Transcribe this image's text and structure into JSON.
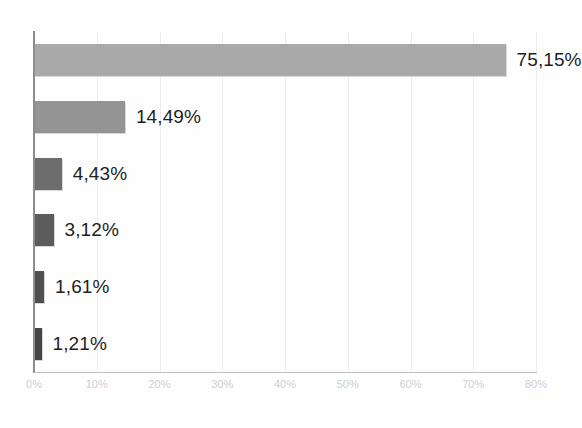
{
  "chart_data": {
    "type": "bar",
    "orientation": "horizontal",
    "title": "",
    "subtitle": "",
    "xlabel": "",
    "ylabel": "",
    "categories": [
      "",
      "",
      "",
      "",
      "",
      ""
    ],
    "values": [
      75.15,
      14.49,
      4.43,
      3.12,
      1.61,
      1.21
    ],
    "data_labels": [
      "75,15%",
      "14,49%",
      "4,43%",
      "3,12%",
      "1,61%",
      "1,21%"
    ],
    "bar_colors": [
      "#a9a9a9",
      "#949494",
      "#6d6d6d",
      "#5c5c5c",
      "#4f4f4f",
      "#454545"
    ],
    "xlim": [
      0,
      80
    ],
    "xticks": [
      0,
      10,
      20,
      30,
      40,
      50,
      60,
      70,
      80
    ],
    "xtick_labels": [
      "0%",
      "10%",
      "20%",
      "30%",
      "40%",
      "50%",
      "60%",
      "70%",
      "80%"
    ],
    "grid": true,
    "grid_axis": "x",
    "grid_color": "#ededed",
    "legend": false,
    "legend_position": "none",
    "axis_color": "#8d8d8d",
    "tick_label_color": "#cfcfcf",
    "data_label_color": "#1f1f1f",
    "background": "#ffffff",
    "decimal_separator": ",",
    "unit": "%"
  }
}
